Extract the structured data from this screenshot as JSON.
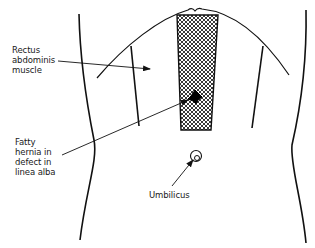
{
  "diagram": {
    "type": "anatomical-illustration",
    "colors": {
      "line": "#111111",
      "background": "#ffffff",
      "mesh": "#222222"
    },
    "labels": {
      "rectus": {
        "lines": [
          "Rectus",
          "abdominis",
          "muscle"
        ]
      },
      "hernia": {
        "lines": [
          "Fatty",
          "hernia in",
          "defect in",
          "linea alba"
        ]
      },
      "umbilicus": {
        "text": "Umbilicus"
      }
    },
    "annotations": [
      {
        "label": "Rectus abdominis muscle",
        "points_to": "left rectus sheath region",
        "arrow": true
      },
      {
        "label": "Fatty hernia in defect in linea alba",
        "points_to": "dark blob within mesh strip",
        "arrow": true
      },
      {
        "label": "Umbilicus",
        "points_to": "umbilicus circle",
        "arrow": true
      }
    ]
  }
}
